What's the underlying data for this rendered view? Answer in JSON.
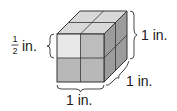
{
  "diagram": {
    "type": "cube-of-unit-cubes",
    "labels": {
      "small_edge": {
        "numerator": "1",
        "denominator": "2",
        "unit": "in."
      },
      "height": "1 in.",
      "depth": "1 in.",
      "width": "1 in."
    },
    "colors": {
      "top_face": "#d9d9d9",
      "front_light": "#e8e8e8",
      "front_face": "#bdbdbd",
      "right_face": "#9c9c9c",
      "edge": "#333333",
      "brace": "#333333"
    }
  }
}
